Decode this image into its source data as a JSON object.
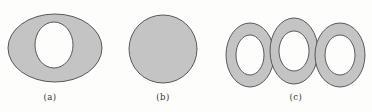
{
  "figure": {
    "colors": {
      "fill": "#c4c4c4",
      "stroke": "#4a4a4a",
      "hole": "#fdfdfb",
      "background": "#fdfdfb"
    },
    "panels": [
      {
        "id": "a",
        "label": "(a)",
        "shape": "ellipse-with-hole",
        "label_x": 50,
        "outer": {
          "cx": 55,
          "cy": 48,
          "rx": 47,
          "ry": 34
        },
        "hole": {
          "cx": 54,
          "cy": 45,
          "rx": 19,
          "ry": 23
        }
      },
      {
        "id": "b",
        "label": "(b)",
        "shape": "solid-circle",
        "label_x": 163,
        "outer": {
          "cx": 163,
          "cy": 49,
          "r": 34
        }
      },
      {
        "id": "c",
        "label": "(c)",
        "shape": "three-linked-rings",
        "label_x": 296,
        "rings": [
          {
            "cx": 250,
            "cy": 55,
            "rx": 24,
            "ry": 32,
            "hole_rx": 14,
            "hole_ry": 20
          },
          {
            "cx": 294,
            "cy": 51,
            "rx": 24,
            "ry": 33,
            "hole_rx": 15,
            "hole_ry": 20
          },
          {
            "cx": 340,
            "cy": 55,
            "rx": 25,
            "ry": 32,
            "hole_rx": 15,
            "hole_ry": 20
          }
        ]
      }
    ]
  }
}
